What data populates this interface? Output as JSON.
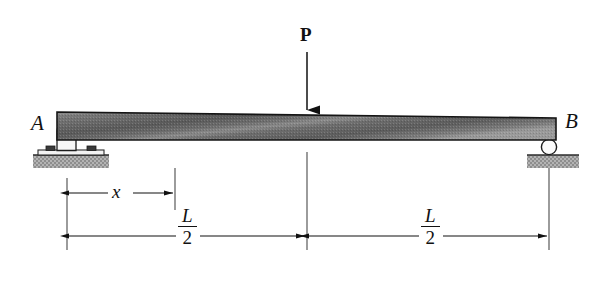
{
  "figure": {
    "background_color": "#ffffff",
    "line_color": "#111111"
  },
  "labels": {
    "support_left": "A",
    "support_right": "B",
    "load": "P",
    "distance_x": "x",
    "half_span_numerator": "L",
    "half_span_denominator": "2"
  },
  "beam": {
    "name": "tapered-beam",
    "fill_light": "#8f8f8f",
    "fill_dark": "#4a4a4a",
    "edge_color": "#1a1a1a"
  },
  "supports": {
    "pin": {
      "name": "pin-support",
      "label": "A",
      "ground_fill": "#a8a8a8"
    },
    "roller": {
      "name": "roller-support",
      "label": "B",
      "ground_fill": "#a8a8a8"
    }
  },
  "load_arrow": {
    "name": "load-arrow-P",
    "label": "P",
    "direction": "down"
  },
  "dimensions": [
    {
      "name": "dimension-x",
      "label": "x",
      "style": "double-arrow"
    },
    {
      "name": "dimension-half-span-left",
      "label": "L/2",
      "style": "double-arrow"
    },
    {
      "name": "dimension-half-span-right",
      "label": "L/2",
      "style": "double-arrow"
    }
  ]
}
